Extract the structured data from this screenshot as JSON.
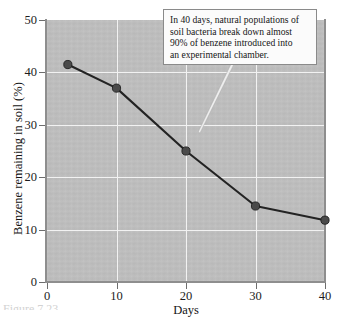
{
  "chart_data": {
    "type": "line",
    "title": "",
    "xlabel": "Days",
    "ylabel": "Benzene remaining in soil (%)",
    "xlim": [
      0,
      40
    ],
    "ylim": [
      0,
      50
    ],
    "xticks": [
      "0",
      "10",
      "20",
      "30",
      "40"
    ],
    "yticks": [
      "0",
      "10",
      "20",
      "30",
      "40",
      "50"
    ],
    "grid": true,
    "legend": "none",
    "plot_background_color": "#bfbfbf",
    "gridline_color": "#f2f2f2",
    "series_color": "#232323",
    "marker_color": "#4a4a4a",
    "x": [
      3,
      10,
      20,
      30,
      40
    ],
    "values": [
      41.5,
      37.0,
      25.0,
      14.5,
      11.8
    ],
    "points": [
      {
        "x": 3,
        "y": 41.5
      },
      {
        "x": 10,
        "y": 37.0
      },
      {
        "x": 20,
        "y": 25.0
      },
      {
        "x": 30,
        "y": 14.5
      },
      {
        "x": 40,
        "y": 11.8
      }
    ],
    "annotations": [
      {
        "text": "In 40 days, natural populations of soil bacteria break down almost 90% of benzene introduced into an experimental chamber.",
        "lines": [
          "In 40 days, natural populations of",
          "soil bacteria break down almost",
          "90% of benzene introduced into",
          "an experimental chamber."
        ],
        "pointer": "leader-line-down-left"
      }
    ]
  },
  "caption": {
    "fragment": "Figure 7.23"
  }
}
